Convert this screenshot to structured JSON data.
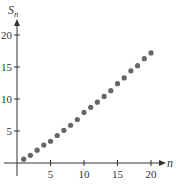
{
  "chart_data": {
    "type": "scatter",
    "title": "",
    "xlabel": "n",
    "ylabel": "S_n",
    "ylabel_main": "S",
    "ylabel_sub": "n",
    "xlim": [
      0,
      21
    ],
    "ylim": [
      0,
      22
    ],
    "xticks": [
      5,
      10,
      15,
      20
    ],
    "yticks": [
      5,
      10,
      15,
      20
    ],
    "grid": false,
    "legend": null,
    "point_color": "#666666",
    "axis_color": "#333333",
    "x": [
      1,
      2,
      3,
      4,
      5,
      6,
      7,
      8,
      9,
      10,
      11,
      12,
      13,
      14,
      15,
      16,
      17,
      18,
      19,
      20
    ],
    "values": [
      0.6,
      1.2,
      2.0,
      2.8,
      3.4,
      4.3,
      5.1,
      5.9,
      6.8,
      7.9,
      8.7,
      9.5,
      10.4,
      11.3,
      12.4,
      13.3,
      14.4,
      15.2,
      16.3,
      17.2
    ]
  }
}
